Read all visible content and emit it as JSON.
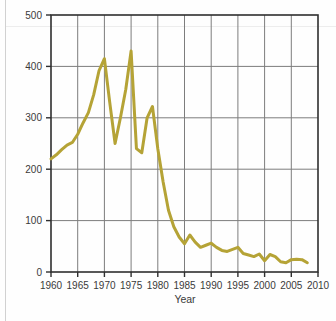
{
  "figure": {
    "background_color": "#fefefe",
    "plot_area": {
      "left": 51,
      "top": 15,
      "right": 318,
      "bottom": 272
    }
  },
  "chart_data": {
    "type": "line",
    "title": "",
    "subtitle": "",
    "xlabel": "Year",
    "ylabel": "",
    "xlim": [
      1960,
      2010
    ],
    "ylim": [
      0,
      500
    ],
    "grid": true,
    "legend": null,
    "line_color": "#b5a336",
    "line_width": 3,
    "x_ticks": [
      1960,
      1965,
      1970,
      1975,
      1980,
      1985,
      1990,
      1995,
      2000,
      2005,
      2010
    ],
    "x_tick_labels": [
      "1960",
      "1965",
      "1970",
      "1975",
      "1980",
      "1985",
      "1990",
      "1995",
      "2000",
      "2005",
      "2010"
    ],
    "y_ticks": [
      0,
      100,
      200,
      300,
      400,
      500
    ],
    "y_tick_labels": [
      "0",
      "100",
      "200",
      "300",
      "400",
      "500"
    ],
    "series": [
      {
        "name": "value",
        "x": [
          1960,
          1961,
          1962,
          1963,
          1964,
          1965,
          1966,
          1967,
          1968,
          1969,
          1970,
          1971,
          1972,
          1973,
          1974,
          1975,
          1976,
          1977,
          1978,
          1979,
          1980,
          1981,
          1982,
          1983,
          1984,
          1985,
          1986,
          1987,
          1988,
          1989,
          1990,
          1991,
          1992,
          1993,
          1994,
          1995,
          1996,
          1997,
          1998,
          1999,
          2000,
          2001,
          2002,
          2003,
          2004,
          2005,
          2006,
          2007,
          2008
        ],
        "values": [
          220,
          228,
          238,
          247,
          252,
          268,
          290,
          310,
          345,
          392,
          415,
          330,
          250,
          300,
          355,
          430,
          240,
          232,
          300,
          322,
          240,
          175,
          120,
          88,
          68,
          55,
          72,
          58,
          48,
          52,
          56,
          48,
          42,
          40,
          44,
          48,
          36,
          33,
          30,
          35,
          22,
          34,
          30,
          20,
          18,
          24,
          25,
          24,
          18
        ]
      }
    ]
  },
  "axis": {
    "x_title": "Year"
  }
}
